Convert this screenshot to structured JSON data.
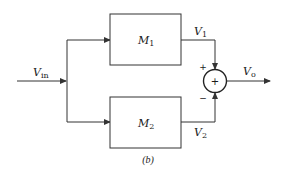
{
  "diagram": {
    "caption": "(b)",
    "input": {
      "label": "V",
      "subscript": "in"
    },
    "blocks": [
      {
        "id": "M1",
        "label": "M",
        "subscript": "1"
      },
      {
        "id": "M2",
        "label": "M",
        "subscript": "2"
      }
    ],
    "signals": [
      {
        "id": "V1",
        "label": "V",
        "subscript": "1"
      },
      {
        "id": "V2",
        "label": "V",
        "subscript": "2"
      }
    ],
    "summer": {
      "symbol": "+",
      "plus_sign": "+",
      "minus_sign": "−"
    },
    "output": {
      "label": "V",
      "subscript": "o"
    },
    "colors": {
      "stroke": "#333333",
      "text": "#1a1a1a",
      "background": "#ffffff"
    }
  }
}
